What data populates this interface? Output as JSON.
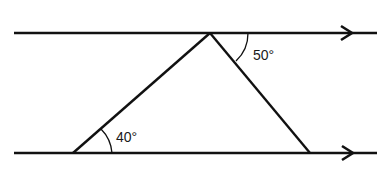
{
  "diagram": {
    "type": "geometry",
    "colors": {
      "stroke": "#111111",
      "background": "#ffffff"
    },
    "parallel_lines": [
      {
        "name": "top-line",
        "y": 33,
        "x1": 14,
        "x2": 377,
        "arrow": "right"
      },
      {
        "name": "bottom-line",
        "y": 153,
        "x1": 14,
        "x2": 377,
        "arrow": "right"
      }
    ],
    "triangle": {
      "vertices": [
        {
          "name": "apex",
          "x": 210,
          "y": 33
        },
        {
          "name": "bottom-left",
          "x": 73,
          "y": 153
        },
        {
          "name": "bottom-right",
          "x": 310,
          "y": 153
        }
      ]
    },
    "angles": [
      {
        "name": "angle-top-right",
        "label": "50°",
        "position": "between top line (right) and right side of triangle"
      },
      {
        "name": "angle-bottom-left",
        "label": "40°",
        "position": "between bottom line and left side of triangle"
      }
    ]
  }
}
